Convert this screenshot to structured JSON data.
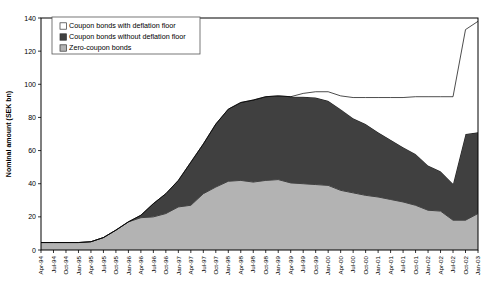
{
  "chart_data": {
    "type": "area",
    "stacked": true,
    "title": "",
    "xlabel": "",
    "ylabel": "Nominal amount (SEK bn)",
    "ylim": [
      0,
      140
    ],
    "yticks": [
      0,
      20,
      40,
      60,
      80,
      100,
      120,
      140
    ],
    "grid": false,
    "legend_position": "top-left",
    "categories": [
      "Apr-94",
      "Jul-94",
      "Oct-94",
      "Jan-95",
      "Apr-95",
      "Jul-95",
      "Oct-95",
      "Jan-96",
      "Apr-96",
      "Jul-96",
      "Oct-96",
      "Jan-97",
      "Apr-97",
      "Jul-97",
      "Oct-97",
      "Jan-98",
      "Apr-98",
      "Jul-98",
      "Oct-98",
      "Jan-99",
      "Apr-99",
      "Jul-99",
      "Oct-99",
      "Jan-00",
      "Apr-00",
      "Jul-00",
      "Oct-00",
      "Jan-01",
      "Apr-01",
      "Jul-01",
      "Oct-01",
      "Jan-02",
      "Apr-02",
      "Jul-02",
      "Oct-02",
      "Jan-03"
    ],
    "series": [
      {
        "name": "Zero-coupon bonds",
        "color": "#b3b3b3",
        "values": [
          4.5,
          4.5,
          4.5,
          4.5,
          5.0,
          7.5,
          12.0,
          17.0,
          19.5,
          20.0,
          22.0,
          26.0,
          27.0,
          34.0,
          38.0,
          41.5,
          42.0,
          41.0,
          42.0,
          42.5,
          40.5,
          40.0,
          39.5,
          39.0,
          36.0,
          34.5,
          33.0,
          32.0,
          30.5,
          29.0,
          27.0,
          24.0,
          23.5,
          18.0,
          18.0,
          22.0
        ]
      },
      {
        "name": "Coupon bonds without deflation floor",
        "color": "#404040",
        "values": [
          0.0,
          0.0,
          0.0,
          0.0,
          0.0,
          0.0,
          0.0,
          0.0,
          1.5,
          8.0,
          12.0,
          16.0,
          26.0,
          30.0,
          38.0,
          43.5,
          47.0,
          49.5,
          50.5,
          50.5,
          52.0,
          52.5,
          52.5,
          51.0,
          49.0,
          45.0,
          43.0,
          39.0,
          36.0,
          33.0,
          31.0,
          27.0,
          24.0,
          22.0,
          52.0,
          49.0
        ]
      },
      {
        "name": "Coupon bonds with deflation floor",
        "color": "#ffffff",
        "values": [
          0.0,
          0.0,
          0.0,
          0.0,
          0.0,
          0.0,
          0.0,
          0.0,
          0.0,
          0.0,
          0.0,
          0.0,
          0.0,
          0.0,
          0.0,
          0.0,
          0.0,
          0.0,
          0.0,
          0.0,
          0.0,
          2.0,
          3.5,
          5.5,
          8.0,
          12.5,
          16.0,
          21.0,
          25.5,
          30.0,
          34.5,
          41.5,
          45.0,
          52.5,
          63.0,
          67.0
        ]
      }
    ],
    "totals": [
      4.5,
      4.5,
      4.5,
      4.5,
      5.0,
      7.5,
      12.0,
      17.0,
      21.0,
      28.0,
      34.0,
      42.0,
      53.0,
      64.0,
      76.0,
      85.0,
      89.0,
      90.5,
      92.5,
      93.0,
      92.5,
      94.5,
      95.5,
      95.5,
      93.0,
      92.0,
      92.0,
      92.0,
      92.0,
      92.0,
      92.5,
      92.5,
      92.5,
      92.5,
      133.0,
      138.0
    ]
  },
  "legend": {
    "items": [
      {
        "label": "Coupon bonds with deflation floor",
        "swatch": "#ffffff"
      },
      {
        "label": "Coupon bonds without deflation floor",
        "swatch": "#404040"
      },
      {
        "label": "Zero-coupon bonds",
        "swatch": "#b3b3b3"
      }
    ]
  }
}
